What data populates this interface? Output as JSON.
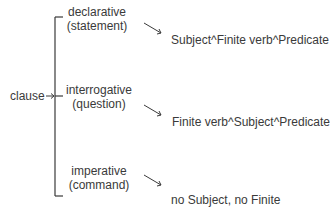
{
  "root": {
    "label": "clause"
  },
  "branches": [
    {
      "type": "declarative",
      "gloss": "(statement)",
      "structure": "Subject^Finite verb^Predicate"
    },
    {
      "type": "interrogative",
      "gloss": "(question)",
      "structure": "Finite verb^Subject^Predicate"
    },
    {
      "type": "imperative",
      "gloss": "(command)",
      "structure": "no Subject, no Finite"
    }
  ],
  "colors": {
    "line": "#3a3a3a",
    "text": "#3a3a3a"
  }
}
